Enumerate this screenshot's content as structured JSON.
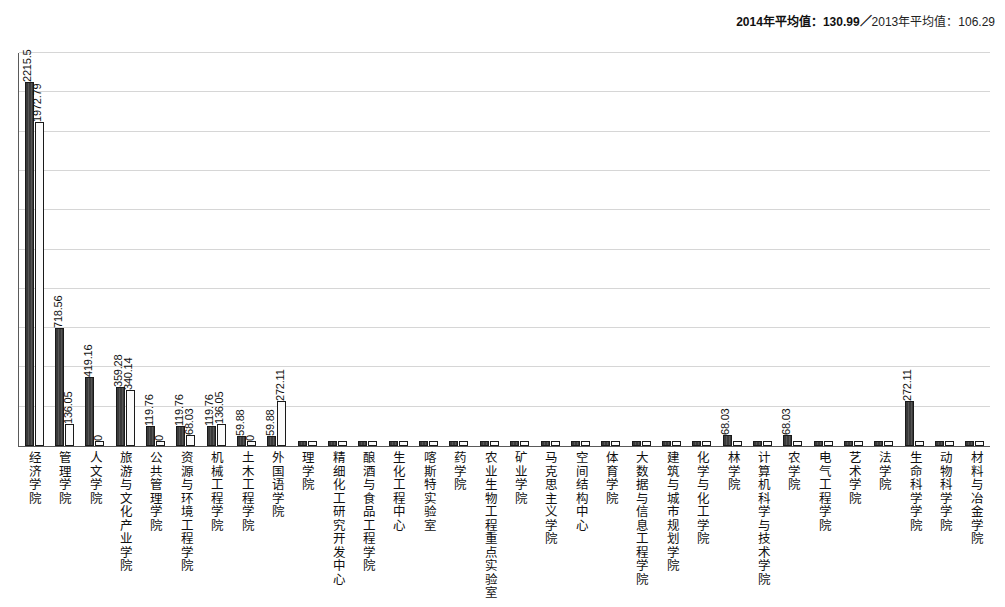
{
  "legend": {
    "text_2014": "2014年平均值：130.99",
    "separator": "／",
    "text_2013": "2013年平均值：106.29"
  },
  "chart_data": {
    "type": "bar",
    "title": "",
    "subtitle": "",
    "xlabel": "",
    "ylabel": "",
    "grid": true,
    "legend_position": "top-right",
    "ylim": [
      0,
      2400
    ],
    "ytick_step": 240,
    "categories": [
      "经济学院",
      "管理学院",
      "人文学院",
      "旅游与文化产业学院",
      "公共管理学院",
      "资源与环境工程学院",
      "机械工程学院",
      "土木工程学院",
      "外国语学院",
      "理学院",
      "精细化工研究开发中心",
      "酿酒与食品工程学院",
      "生化工程中心",
      "喀斯特实验室",
      "药学院",
      "农业生物工程重点实验室",
      "矿业学院",
      "马克思主义学院",
      "空间结构中心",
      "体育学院",
      "大数据与信息工程学院",
      "建筑与城市规划学院",
      "化学与化工学院",
      "林学院",
      "计算机科学与技术学院",
      "农学院",
      "电气工程学院",
      "艺术学院",
      "法学院",
      "生命科学学院",
      "动物科学学院",
      "材料与冶金学院"
    ],
    "series": [
      {
        "name": "2014年",
        "color": "#3f3f3f",
        "values": [
          2215.5,
          718.56,
          419.16,
          359.28,
          119.76,
          119.76,
          119.76,
          59.88,
          59.88,
          0,
          0,
          0,
          0,
          0,
          0,
          0,
          0,
          0,
          0,
          0,
          0,
          0,
          0,
          68.03,
          0,
          68.03,
          0,
          0,
          0,
          272.11,
          0,
          0
        ]
      },
      {
        "name": "2013年",
        "color": "#fbfbfb",
        "values": [
          1972.79,
          136.05,
          0,
          340.14,
          0,
          68.03,
          136.05,
          0,
          272.11,
          0,
          0,
          0,
          0,
          0,
          0,
          0,
          0,
          0,
          0,
          0,
          0,
          0,
          0,
          0,
          0,
          0,
          0,
          0,
          0,
          0,
          0,
          0
        ]
      }
    ],
    "value_labels": [
      {
        "category": "经济学院",
        "series": "2014年",
        "label": "2215.5"
      },
      {
        "category": "经济学院",
        "series": "2013年",
        "label": "1972.79"
      },
      {
        "category": "管理学院",
        "series": "2014年",
        "label": "718.56"
      },
      {
        "category": "管理学院",
        "series": "2013年",
        "label": "136.05"
      },
      {
        "category": "人文学院",
        "series": "2014年",
        "label": "419.16"
      },
      {
        "category": "人文学院",
        "series": "2013年",
        "label": "0"
      },
      {
        "category": "旅游与文化产业学院",
        "series": "2014年",
        "label": "359.28"
      },
      {
        "category": "旅游与文化产业学院",
        "series": "2013年",
        "label": "340.14"
      },
      {
        "category": "公共管理学院",
        "series": "2014年",
        "label": "119.76"
      },
      {
        "category": "公共管理学院",
        "series": "2013年",
        "label": "0"
      },
      {
        "category": "资源与环境工程学院",
        "series": "2014年",
        "label": "119.76"
      },
      {
        "category": "资源与环境工程学院",
        "series": "2013年",
        "label": "68.03"
      },
      {
        "category": "机械工程学院",
        "series": "2014年",
        "label": "119.76"
      },
      {
        "category": "机械工程学院",
        "series": "2013年",
        "label": "136.05"
      },
      {
        "category": "土木工程学院",
        "series": "2014年",
        "label": "59.88"
      },
      {
        "category": "土木工程学院",
        "series": "2013年",
        "label": "0"
      },
      {
        "category": "外国语学院",
        "series": "2014年",
        "label": "59.88"
      },
      {
        "category": "外国语学院",
        "series": "2013年",
        "label": "272.11"
      },
      {
        "category": "林学院",
        "series": "2014年",
        "label": "68.03"
      },
      {
        "category": "农学院",
        "series": "2014年",
        "label": "68.03"
      },
      {
        "category": "生命科学学院",
        "series": "2014年",
        "label": "272.11"
      }
    ]
  }
}
